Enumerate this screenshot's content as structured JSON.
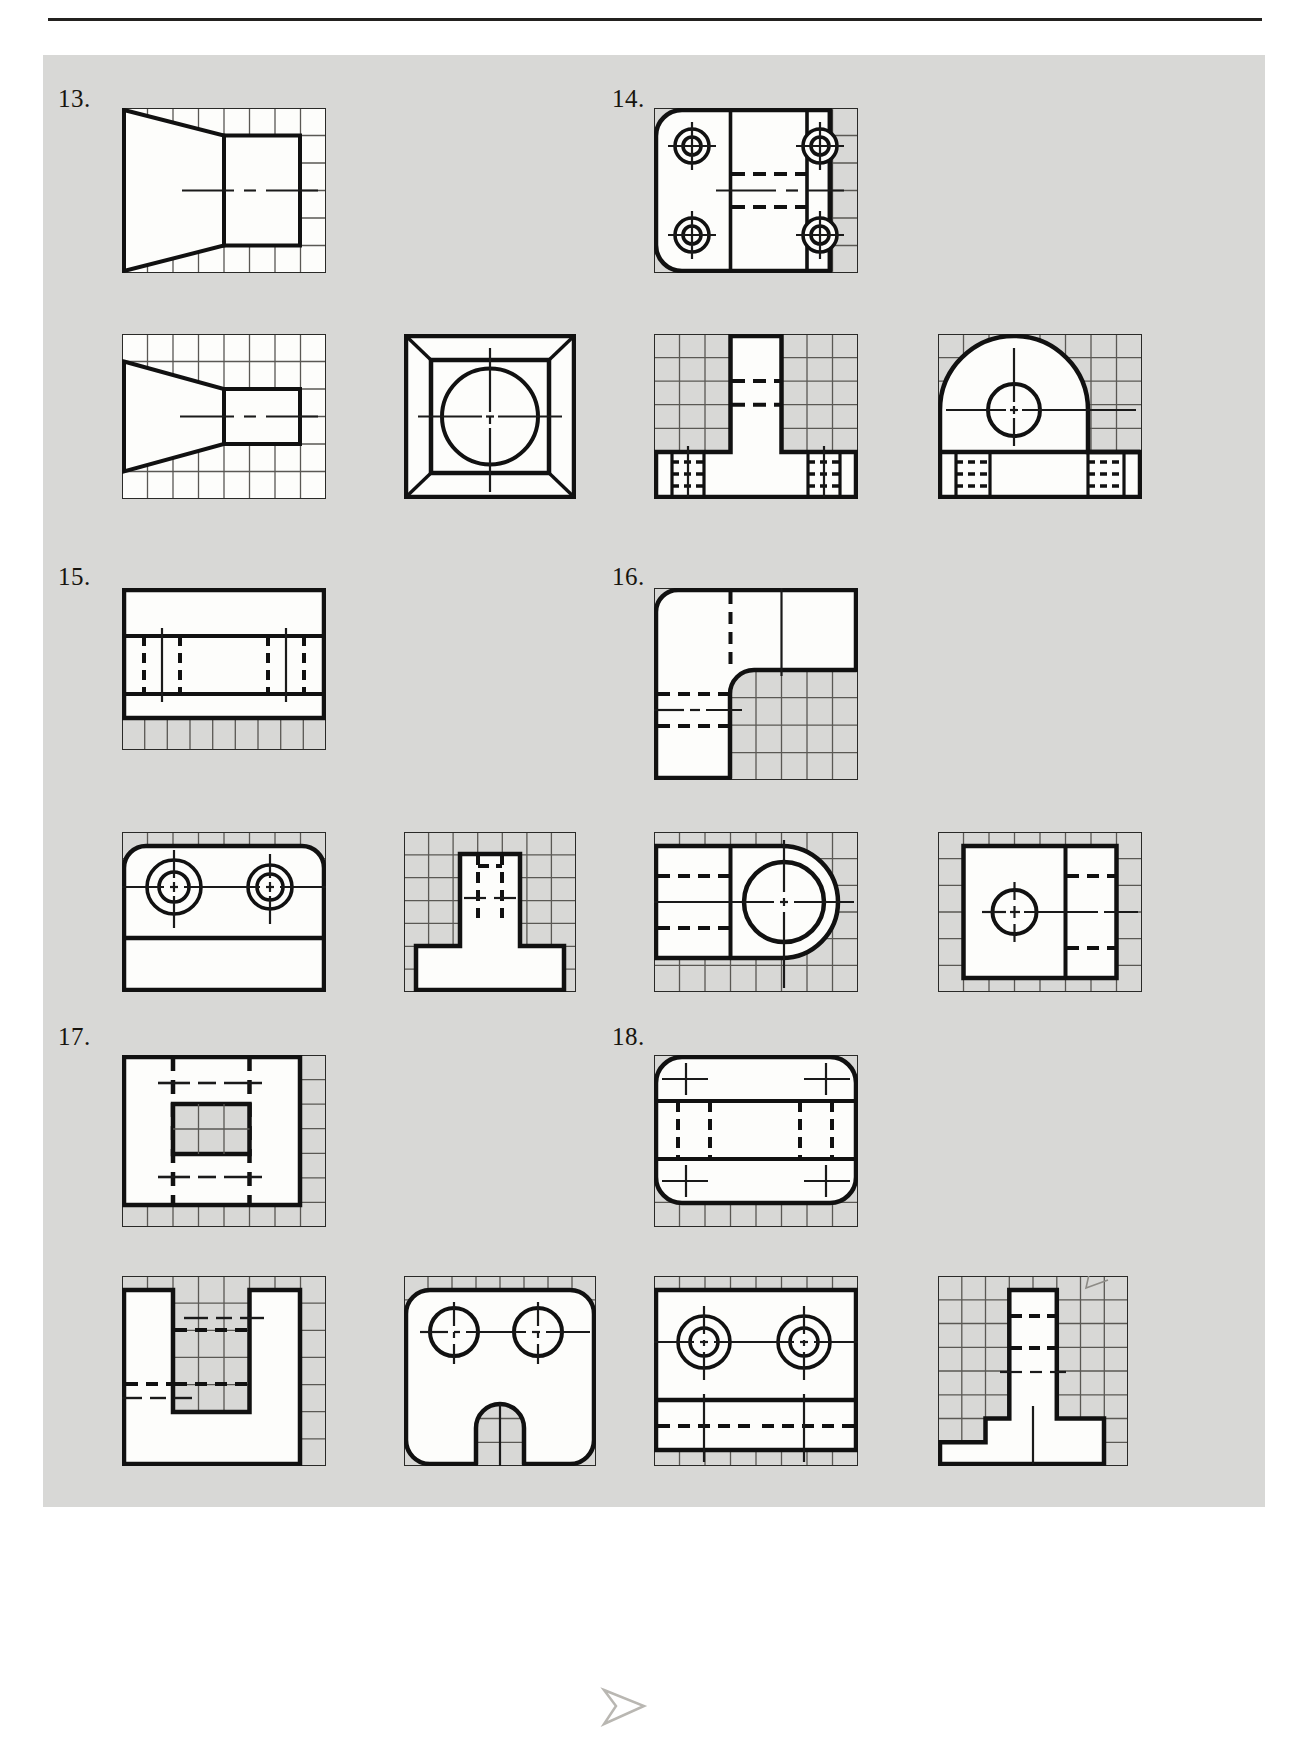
{
  "page": {
    "background_color": "#ffffff",
    "panel_color": "#d8d8d6",
    "rule_color": "#23211f",
    "ink_color": "#1a1a1a",
    "grid_color": "#55534e",
    "white_fill": "#fdfdfb"
  },
  "problems": [
    {
      "number": "13.",
      "label_x": 58,
      "label_y": 85,
      "views": [
        {
          "name": "front-view",
          "description": "truncated-wedge front view on grid",
          "grid_cols": 8,
          "grid_rows": 6
        },
        {
          "name": "top-view",
          "description": "truncated-wedge top view on grid",
          "grid_cols": 8,
          "grid_rows": 5
        }
      ]
    },
    {
      "number": "14.",
      "label_x": 612,
      "label_y": 85,
      "views": [
        {
          "name": "front-view",
          "description": "rounded-corner plate with four counterbored holes",
          "grid_cols": 8,
          "grid_rows": 6
        }
      ]
    },
    {
      "number": "15.",
      "label_x": 58,
      "label_y": 563,
      "views": [
        {
          "name": "front-view",
          "description": "rectangular block with hidden slot lines",
          "grid_cols": 9,
          "grid_rows": 5
        }
      ]
    },
    {
      "number": "16.",
      "label_x": 612,
      "label_y": 563,
      "views": [
        {
          "name": "front-view",
          "description": "L-shaped bracket with rounded corners and hidden lines",
          "grid_cols": 8,
          "grid_rows": 7
        }
      ]
    },
    {
      "number": "17.",
      "label_x": 58,
      "label_y": 1023,
      "views": [
        {
          "name": "front-view",
          "description": "square plate with central rectangular pocket and hidden lines",
          "grid_cols": 8,
          "grid_rows": 7
        }
      ]
    },
    {
      "number": "18.",
      "label_x": 612,
      "label_y": 1023,
      "views": [
        {
          "name": "front-view",
          "description": "rounded rectangular plate with hidden slot and two small center marks",
          "grid_cols": 8,
          "grid_rows": 6
        }
      ]
    }
  ],
  "answer_views": {
    "row2": [
      {
        "name": "answer-13-bottom",
        "description": "truncated wedge side view"
      },
      {
        "name": "answer-square-circle",
        "description": "square frame with inscribed circle and corner miters"
      },
      {
        "name": "answer-tee-block",
        "description": "T-shaped block with hidden lines in the base"
      },
      {
        "name": "answer-dome-hole",
        "description": "half-round top block with central hole and hidden base lines"
      }
    ],
    "row4": [
      {
        "name": "answer-two-hole-plate",
        "description": "plate with two counterbored holes and rounded top corners"
      },
      {
        "name": "answer-tee-column",
        "description": "T-shaped column with hidden vertical slot"
      },
      {
        "name": "answer-big-hole-block",
        "description": "block with large circle, rounded right end and hidden lines"
      },
      {
        "name": "answer-small-hole-block",
        "description": "block with small central circle and hidden lines at right"
      }
    ],
    "row6": [
      {
        "name": "answer-u-channel",
        "description": "U-shaped channel with hidden lines"
      },
      {
        "name": "answer-two-circle-arch",
        "description": "rounded block with two circles and arched notch in base"
      },
      {
        "name": "answer-counterbore-plate",
        "description": "plate with two counterbored circles and hidden lines at base"
      },
      {
        "name": "answer-step-column",
        "description": "stepped column with hidden lines"
      }
    ]
  },
  "icons": {
    "centerline": "center-line",
    "hidden_line": "hidden-line",
    "object_line": "object-line",
    "grid": "isometric-grid"
  }
}
